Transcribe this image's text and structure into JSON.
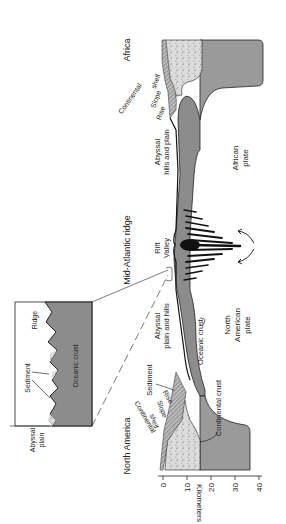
{
  "figure": {
    "orientation": "rotated-90-ccw",
    "colors": {
      "oceanic_crust": "#8c8c8c",
      "continental_crust": "#d9d9d9",
      "mantle_plate": "#9a9a9a",
      "sediment": "#c8c8c8",
      "ink": "#1a1a1a"
    },
    "labels": {
      "africa": "Africa",
      "north_america": "North America",
      "mid_atlantic_ridge": "Mid-Atlantic ridge",
      "rift_valley_1": "Rift",
      "rift_valley_2": "Valley",
      "africa_continental_shelf_1": "Continental",
      "africa_continental_shelf_2": "shelf",
      "africa_slope": "Slope",
      "africa_rise": "Rise",
      "africa_abyssal_1": "Abyssal",
      "africa_abyssal_2": "hills and plain",
      "african_plate_1": "African",
      "african_plate_2": "plate",
      "na_abyssal_1": "Abyssal",
      "na_abyssal_2": "plain and hills",
      "na_oceanic_crust": "Oceanic crust",
      "na_plate_1": "North",
      "na_plate_2": "American",
      "na_plate_3": "plate",
      "na_sediment": "Sediment",
      "na_continental_crust": "Continental crust",
      "na_rise": "Rise",
      "na_slope": "Slope",
      "na_shelf_1": "Continental",
      "na_shelf_2": "shelf"
    },
    "inset": {
      "ridge": "Ridge",
      "sediment": "Sediment",
      "oceanic_crust": "Oceanic crust",
      "abyssal_plain_1": "Abyssal",
      "abyssal_plain_2": "plain"
    },
    "axis": {
      "title": "Kilometers",
      "ticks": [
        "0",
        "10",
        "20",
        "30",
        "40"
      ]
    }
  }
}
